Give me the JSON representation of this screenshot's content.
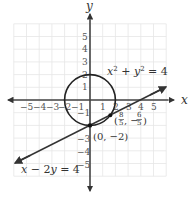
{
  "chart_data": {
    "type": "line",
    "title": "",
    "xlabel": "x",
    "ylabel": "y",
    "xlim": [
      -6,
      6
    ],
    "ylim": [
      -6,
      6
    ],
    "grid": true,
    "x_ticks": [
      "−5",
      "−4",
      "−3",
      "−2",
      "−1",
      "1",
      "2",
      "3",
      "4",
      "5"
    ],
    "y_ticks": [
      "5",
      "4",
      "3",
      "2",
      "1",
      "−1",
      "−3",
      "−4",
      "−5"
    ],
    "series": [
      {
        "name": "x² + y² = 4",
        "kind": "circle",
        "center": [
          0,
          0
        ],
        "radius": 2,
        "color": "#222222"
      },
      {
        "name": "x − 2y = 4",
        "kind": "line",
        "slope": 0.5,
        "intercept": -2,
        "x_range": [
          -6,
          6
        ],
        "color": "#333333"
      }
    ],
    "points": [
      {
        "label": "(0, −2)",
        "x": 0,
        "y": -2
      },
      {
        "label": "(8/5, −6/5)",
        "x": 1.6,
        "y": -1.2
      }
    ],
    "annotations": {
      "circle_label": {
        "base": "x",
        "sup1": "2",
        "mid": " + ",
        "base2": "y",
        "sup2": "2",
        "rest": " = 4"
      },
      "line_label": {
        "a": "x",
        "b": " − 2",
        "c": "y",
        "d": " = 4"
      },
      "point_a_label": "(0, −2)",
      "point_b_label": {
        "open": "(",
        "num1": "8",
        "den1": "5",
        "sep": ", −",
        "num2": "6",
        "den2": "5",
        "close": ")"
      }
    }
  },
  "axes": {
    "x_label": "x",
    "y_label": "y"
  }
}
